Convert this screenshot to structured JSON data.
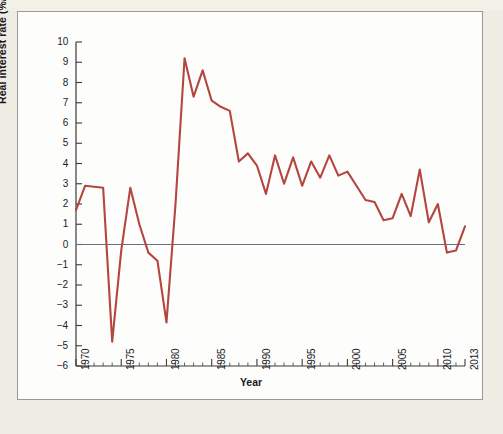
{
  "figure": {
    "background_color": "#fdfdfb",
    "page_color": "#efece4",
    "frame_border_color": "#9a9a96",
    "caption_fragment": ""
  },
  "chart_data": {
    "type": "line",
    "title": "",
    "xlabel": "Year",
    "ylabel": "Real interest rate (%/year)",
    "xlim": [
      1970,
      2013
    ],
    "ylim": [
      -6,
      10
    ],
    "grid": false,
    "legend": null,
    "line_color": "#b4453f",
    "zero_line_color": "#6b6f8c",
    "x_major_ticks": [
      1970,
      1975,
      1980,
      1985,
      1990,
      1995,
      2000,
      2005,
      2010,
      2013
    ],
    "x_tick_labels": [
      "1970",
      "1975",
      "1980",
      "1985",
      "1990",
      "1995",
      "2000",
      "2005",
      "2010",
      "2013"
    ],
    "x_minor_tick_interval": 1,
    "y_ticks": [
      10,
      9,
      8,
      7,
      6,
      5,
      4,
      3,
      2,
      1,
      0,
      -1,
      -2,
      -3,
      -4,
      -5,
      -6
    ],
    "y_tick_labels": [
      "10",
      "9",
      "8",
      "7",
      "6",
      "5",
      "4",
      "3",
      "2",
      "1",
      "0",
      "−1",
      "−2",
      "−3",
      "−4",
      "−5",
      "−6"
    ],
    "series": [
      {
        "name": "Real interest rate",
        "x": [
          1970,
          1971,
          1972,
          1973,
          1974,
          1975,
          1976,
          1977,
          1978,
          1979,
          1980,
          1981,
          1982,
          1983,
          1984,
          1985,
          1986,
          1987,
          1988,
          1989,
          1990,
          1991,
          1992,
          1993,
          1994,
          1995,
          1996,
          1997,
          1998,
          1999,
          2000,
          2001,
          2002,
          2003,
          2004,
          2005,
          2006,
          2007,
          2008,
          2009,
          2010,
          2011,
          2012,
          2013
        ],
        "values": [
          1.7,
          2.9,
          2.85,
          2.8,
          -4.8,
          -0.3,
          2.8,
          1.0,
          -0.4,
          -0.8,
          -3.85,
          2.0,
          9.2,
          7.3,
          8.6,
          7.1,
          6.8,
          6.6,
          4.1,
          4.5,
          3.9,
          2.5,
          4.4,
          3.0,
          4.3,
          2.9,
          4.1,
          3.3,
          4.4,
          3.4,
          3.6,
          2.9,
          2.2,
          2.1,
          1.2,
          1.3,
          2.5,
          1.4,
          3.7,
          1.1,
          2.0,
          -0.4,
          -0.3,
          0.9
        ]
      }
    ]
  }
}
